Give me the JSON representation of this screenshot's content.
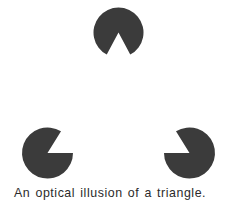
{
  "figure": {
    "caption": "An optical illusion of a triangle.",
    "title": "An optical illusion of a triangle.",
    "background_color": "#ffffff",
    "shape_color": "#3b3b3b",
    "caption_color": "#2b2b2b"
  },
  "illusion": {
    "name": "Kanizsa triangle",
    "inducer_count": 3,
    "inducers": [
      {
        "id": "top-inducer",
        "label": "top pac-man inducer",
        "center_x": 118.5,
        "center_y": 32.5,
        "radius": 25,
        "wedge_start_deg": 62,
        "wedge_end_deg": 118,
        "wedge_direction": "down"
      },
      {
        "id": "bottom-left-inducer",
        "label": "bottom-left pac-man inducer",
        "center_x": 47.5,
        "center_y": 153,
        "radius": 25.5,
        "wedge_start_deg": 302,
        "wedge_end_deg": 360,
        "wedge_direction": "up-right"
      },
      {
        "id": "bottom-right-inducer",
        "label": "bottom-right pac-man inducer",
        "center_x": 189.5,
        "center_y": 153,
        "radius": 25.5,
        "wedge_start_deg": 180,
        "wedge_end_deg": 238,
        "wedge_direction": "up-left"
      }
    ]
  }
}
